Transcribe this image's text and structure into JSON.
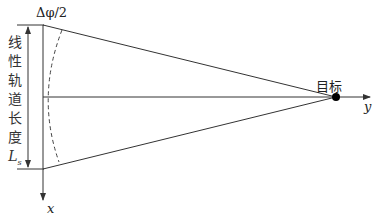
{
  "diagram": {
    "angle_label": "Δφ/2",
    "length_label_chars": [
      "线",
      "性",
      "轨",
      "道",
      "长",
      "度"
    ],
    "length_symbol": "L",
    "length_subscript": "s",
    "target_label": "目标",
    "x_axis_label": "x",
    "y_axis_label": "y",
    "colors": {
      "line": "#333333",
      "target": "#000000",
      "background": "#ffffff"
    }
  }
}
